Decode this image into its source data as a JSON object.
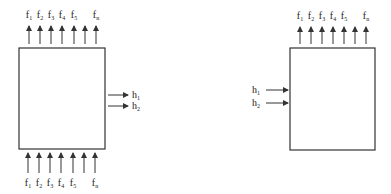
{
  "diagram": {
    "colors": {
      "stroke": "#333333",
      "background": "#ffffff"
    },
    "left_system": {
      "box": {
        "x": 19,
        "y": 48,
        "w": 86,
        "h": 101
      },
      "top_outputs": [
        {
          "base": "f",
          "sub": "1",
          "x": 29
        },
        {
          "base": "f",
          "sub": "2",
          "x": 40
        },
        {
          "base": "f",
          "sub": "3",
          "x": 51
        },
        {
          "base": "f",
          "sub": "4",
          "x": 62
        },
        {
          "base": "f",
          "sub": "5",
          "x": 74
        },
        {
          "base": "",
          "sub": "",
          "x": 85
        },
        {
          "base": "f",
          "sub": "n",
          "x": 96
        }
      ],
      "bottom_inputs": [
        {
          "base": "f",
          "sub": "1",
          "x": 28
        },
        {
          "base": "f",
          "sub": "2",
          "x": 39
        },
        {
          "base": "f",
          "sub": "3",
          "x": 50
        },
        {
          "base": "f",
          "sub": "4",
          "x": 61
        },
        {
          "base": "f",
          "sub": "5",
          "x": 73
        },
        {
          "base": "",
          "sub": "",
          "x": 84
        },
        {
          "base": "f",
          "sub": "n",
          "x": 95
        }
      ],
      "side_outputs": [
        {
          "base": "h",
          "sub": "1",
          "y": 95
        },
        {
          "base": "h",
          "sub": "2",
          "y": 106
        }
      ]
    },
    "right_system": {
      "box": {
        "x": 290,
        "y": 48,
        "w": 85,
        "h": 102
      },
      "top_outputs": [
        {
          "base": "f",
          "sub": "1",
          "x": 300
        },
        {
          "base": "f",
          "sub": "2",
          "x": 311
        },
        {
          "base": "f",
          "sub": "3",
          "x": 322
        },
        {
          "base": "f",
          "sub": "4",
          "x": 333
        },
        {
          "base": "f",
          "sub": "5",
          "x": 344
        },
        {
          "base": "",
          "sub": "",
          "x": 355
        },
        {
          "base": "f",
          "sub": "n",
          "x": 366
        }
      ],
      "side_inputs": [
        {
          "base": "h",
          "sub": "1",
          "y": 90
        },
        {
          "base": "h",
          "sub": "2",
          "y": 103
        }
      ]
    }
  }
}
